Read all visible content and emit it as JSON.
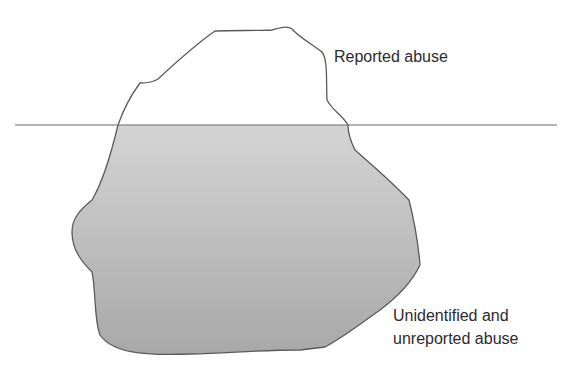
{
  "diagram": {
    "type": "iceberg",
    "colors": {
      "outline": "#5a5a5a",
      "waterline": "#6a6a6a",
      "fill_top": "#d2d2d2",
      "fill_bottom": "#a9a9a9",
      "background": "#ffffff",
      "text": "#2b2b2b"
    },
    "labels": {
      "above_water": "Reported abuse",
      "below_water_line1": "Unidentified and",
      "below_water_line2": "unreported abuse"
    }
  }
}
